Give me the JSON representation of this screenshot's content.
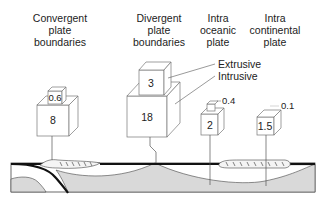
{
  "settings": [
    {
      "id": "convergent",
      "title_lines": [
        "Convergent",
        "plate",
        "boundaries"
      ],
      "extrusive": "0.6",
      "intrusive": "8"
    },
    {
      "id": "divergent",
      "title_lines": [
        "Divergent",
        "plate",
        "boundaries"
      ],
      "extrusive": "3",
      "intrusive": "18"
    },
    {
      "id": "intra-oceanic",
      "title_lines": [
        "Intra",
        "oceanic",
        "plate"
      ],
      "extrusive": "0.4",
      "intrusive": "2"
    },
    {
      "id": "intra-continental",
      "title_lines": [
        "Intra",
        "continental",
        "plate"
      ],
      "extrusive": "0.1",
      "intrusive": "1.5"
    }
  ],
  "legend": {
    "extrusive": "Extrusive",
    "intrusive": "Intrusive"
  },
  "colors": {
    "line": "#555555",
    "plate": "#111111",
    "mantle_fill": "#d9d9d9",
    "crust_fill": "#ffffff"
  }
}
